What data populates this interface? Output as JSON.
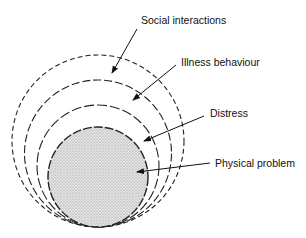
{
  "diagram": {
    "type": "nested-tangent-circles",
    "tangent_point": {
      "x": 98,
      "y": 227
    },
    "layers": [
      {
        "id": "social",
        "label": "Social interactions",
        "r": 86,
        "cx": 98,
        "cy": 141,
        "dash": "5 3",
        "fill": "none",
        "label_pos": {
          "x": 141,
          "y": 24
        },
        "arrow": {
          "x1": 137,
          "y1": 29,
          "x2": 112,
          "y2": 73
        }
      },
      {
        "id": "illness",
        "label": "Illness behaviour",
        "r": 73.5,
        "cx": 98,
        "cy": 153.5,
        "dash": "8 3",
        "fill": "none",
        "label_pos": {
          "x": 181,
          "y": 66
        },
        "arrow": {
          "x1": 176,
          "y1": 65,
          "x2": 133,
          "y2": 100
        }
      },
      {
        "id": "distress",
        "label": "Distress",
        "r": 61,
        "cx": 98,
        "cy": 166,
        "dash": "10 3",
        "fill": "none",
        "label_pos": {
          "x": 210,
          "y": 117
        },
        "arrow": {
          "x1": 204,
          "y1": 116,
          "x2": 144,
          "y2": 141
        }
      },
      {
        "id": "physical",
        "label": "Physical problem",
        "r": 50,
        "cx": 98,
        "cy": 177,
        "dash": "9 2",
        "fill": "stipple",
        "label_pos": {
          "x": 215,
          "y": 167
        },
        "arrow": {
          "x1": 210,
          "y1": 163,
          "x2": 137,
          "y2": 172
        }
      }
    ],
    "colors": {
      "stroke": "#222222",
      "stipple_bg": "#e4e4e4",
      "stipple_dot": "#8a8a8a"
    }
  }
}
